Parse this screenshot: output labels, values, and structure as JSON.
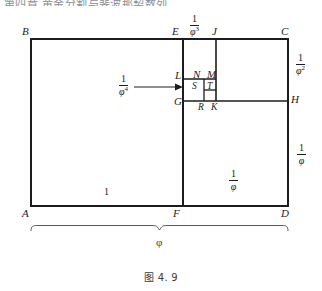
{
  "page": {
    "cropped_header_text": "第四章   黄金分割与斐波那契数列",
    "caption": "图 4. 9",
    "ink_color": "#1c1c1c",
    "background_color": "#ffffff"
  },
  "diagram": {
    "vertices": [
      {
        "id": "A",
        "label": "A",
        "x": 31,
        "y": 212
      },
      {
        "id": "B",
        "label": "B",
        "x": 22,
        "y": 33
      },
      {
        "id": "C",
        "label": "C",
        "x": 287,
        "y": 33
      },
      {
        "id": "D",
        "label": "D",
        "x": 285,
        "y": 212
      },
      {
        "id": "E",
        "label": "E",
        "x": 176,
        "y": 33
      },
      {
        "id": "F",
        "label": "F",
        "x": 176,
        "y": 212
      },
      {
        "id": "G",
        "label": "G",
        "x": 176,
        "y": 104
      },
      {
        "id": "H",
        "label": "H",
        "x": 292,
        "y": 100
      },
      {
        "id": "J",
        "label": "J",
        "x": 211,
        "y": 33
      },
      {
        "id": "K",
        "label": "K",
        "x": 212,
        "y": 113
      },
      {
        "id": "L",
        "label": "L",
        "x": 177,
        "y": 76
      },
      {
        "id": "M",
        "label": "M",
        "x": 206,
        "y": 74
      },
      {
        "id": "N",
        "label": "N",
        "x": 196,
        "y": 74
      },
      {
        "id": "R",
        "label": "R",
        "x": 199,
        "y": 113
      },
      {
        "id": "S",
        "label": "S",
        "x": 193,
        "y": 89
      },
      {
        "id": "T",
        "label": "T",
        "x": 206,
        "y": 88
      }
    ],
    "measures": [
      {
        "id": "m-phi3",
        "text": "1/φ³",
        "numerator": "1",
        "denominator": "φ",
        "exponent": "3",
        "position": "top-edge-EJ"
      },
      {
        "id": "m-phi2",
        "text": "1/φ²",
        "numerator": "1",
        "denominator": "φ",
        "exponent": "2",
        "position": "right-edge-CH"
      },
      {
        "id": "m-phi1r",
        "text": "1/φ",
        "numerator": "1",
        "denominator": "φ",
        "exponent": "",
        "position": "right-edge-HD"
      },
      {
        "id": "m-phi4",
        "text": "1/φ⁴",
        "numerator": "1",
        "denominator": "φ",
        "exponent": "4",
        "position": "arrow-left-of-LG"
      },
      {
        "id": "m-phi1b",
        "text": "1/φ",
        "numerator": "1",
        "denominator": "φ",
        "exponent": "",
        "position": "bottom-region-FD"
      },
      {
        "id": "m-one",
        "text": "1",
        "numerator": "1",
        "denominator": "",
        "exponent": "",
        "position": "bottom-region-AF"
      }
    ],
    "brace": {
      "label": "φ",
      "span": "A-to-D",
      "position": "below-figure"
    }
  }
}
